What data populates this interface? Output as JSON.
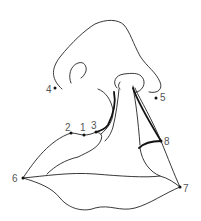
{
  "diagram": {
    "background": "#ffffff",
    "stroke_color": "#222222",
    "label_color": "#555555",
    "landmarks": [
      {
        "id": "1",
        "label": "1",
        "x": 84,
        "y": 135
      },
      {
        "id": "2",
        "label": "2",
        "x": 71,
        "y": 133
      },
      {
        "id": "3",
        "label": "3",
        "x": 96,
        "y": 132
      },
      {
        "id": "4",
        "label": "4",
        "x": 55,
        "y": 88
      },
      {
        "id": "5",
        "label": "5",
        "x": 156,
        "y": 98
      },
      {
        "id": "6",
        "label": "6",
        "x": 23,
        "y": 178
      },
      {
        "id": "7",
        "label": "7",
        "x": 180,
        "y": 187
      },
      {
        "id": "8",
        "label": "8",
        "x": 161,
        "y": 141
      }
    ]
  }
}
